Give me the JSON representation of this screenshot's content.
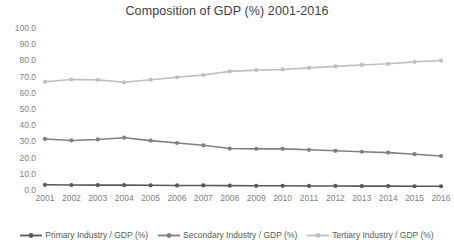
{
  "chart_data": {
    "type": "line",
    "title": "Composition of GDP (%) 2001-2016",
    "xlabel": "",
    "ylabel": "",
    "ylim": [
      0.0,
      100.0
    ],
    "ytick_step": 10.0,
    "grid": false,
    "legend_position": "bottom",
    "categories": [
      "2001",
      "2002",
      "2003",
      "2004",
      "2005",
      "2006",
      "2007",
      "2008",
      "2009",
      "2010",
      "2011",
      "2012",
      "2013",
      "2014",
      "2015",
      "2016"
    ],
    "yticks": [
      "100.0",
      "90.0",
      "80.0",
      "70.0",
      "60.0",
      "50.0",
      "40.0",
      "30.0",
      "20.0",
      "10.0",
      "0.0"
    ],
    "series": [
      {
        "name": "Primary Industry / GDP (%)",
        "color": "#595959",
        "marker": "circle",
        "values": [
          3.2,
          3.1,
          3.0,
          3.0,
          2.9,
          2.8,
          2.8,
          2.7,
          2.6,
          2.6,
          2.5,
          2.5,
          2.4,
          2.4,
          2.3,
          2.3
        ]
      },
      {
        "name": "Secondary Industry / GDP (%)",
        "color": "#808080",
        "marker": "circle",
        "values": [
          31.5,
          30.6,
          31.2,
          32.3,
          30.5,
          29.0,
          27.6,
          25.6,
          25.4,
          25.4,
          24.8,
          24.2,
          23.6,
          23.1,
          22.1,
          21.0
        ]
      },
      {
        "name": "Tertiary Industry / GDP (%)",
        "color": "#bfbfbf",
        "marker": "circle",
        "values": [
          66.8,
          68.2,
          68.0,
          66.5,
          68.1,
          69.6,
          71.0,
          73.2,
          74.0,
          74.4,
          75.4,
          76.3,
          77.2,
          77.9,
          79.1,
          79.9
        ]
      }
    ]
  },
  "legend": {
    "items": [
      {
        "label": "Primary Industry / GDP (%)"
      },
      {
        "label": "Secondary Industry / GDP (%)"
      },
      {
        "label": "Tertiary Industry / GDP (%)"
      }
    ]
  }
}
